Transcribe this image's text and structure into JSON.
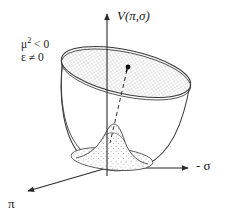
{
  "figure": {
    "name": "mexican-hat-potential",
    "background_color": "#ffffff",
    "stroke_color": "#2b2b2b",
    "stipple_color": "#8c8c8c"
  },
  "axes": {
    "vertical": {
      "label": "V(π,σ)",
      "icon": "axis-arrow-up",
      "from": [
        107,
        176
      ],
      "to": [
        107,
        12
      ]
    },
    "horizontal": {
      "label": "- σ",
      "icon": "axis-arrow-right",
      "from": [
        107,
        168
      ],
      "to": [
        190,
        168
      ]
    },
    "depth": {
      "label": "π",
      "icon": "axis-arrow-down-left",
      "from": [
        107,
        168
      ],
      "to": [
        26,
        192
      ]
    }
  },
  "annotations": {
    "condition_line1_base": "μ",
    "condition_line1_exp": "2",
    "condition_line1_rest": "< 0",
    "condition_line2": "ε ≠ 0"
  },
  "markers": {
    "vacuum_point": {
      "x": 128,
      "y": 68,
      "label": "vacuum-point-dot"
    },
    "dashed_line": {
      "from": [
        128,
        68
      ],
      "to": [
        110,
        143
      ],
      "style": "dashed"
    }
  },
  "surface": {
    "rim_ellipse": {
      "cx": 126,
      "cy": 72,
      "rx": 66,
      "ry": 22,
      "rotation": 12
    },
    "trough_ellipse": {
      "cx": 112,
      "cy": 160,
      "rx": 40,
      "ry": 11,
      "rotation": 6
    },
    "hump_peak": {
      "x": 113,
      "y": 130
    }
  }
}
